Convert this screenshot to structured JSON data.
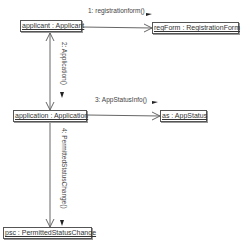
{
  "diagram": {
    "type": "uml-collaboration",
    "objects": [
      {
        "id": "applicant",
        "label": "applicant : Applicant"
      },
      {
        "id": "regForm",
        "label": "regForm : RegistrationForm"
      },
      {
        "id": "application",
        "label": "application : Application"
      },
      {
        "id": "as",
        "label": "as : AppStatus"
      },
      {
        "id": "psc",
        "label": "psc : PermittedStatusChange"
      }
    ],
    "messages": [
      {
        "seq": "1",
        "label": "1: registrationform()",
        "from": "applicant",
        "to": "regForm",
        "arrow": "→"
      },
      {
        "seq": "2",
        "label": "2: Application()",
        "from": "applicant",
        "to": "application",
        "arrow": "→"
      },
      {
        "seq": "3",
        "label": "3: AppStatusInfo()",
        "from": "application",
        "to": "as",
        "arrow": "→"
      },
      {
        "seq": "4",
        "label": "4: PermittedStatusChange()",
        "from": "application",
        "to": "psc",
        "arrow": "→"
      }
    ],
    "colors": {
      "line": "#555555",
      "text": "#333333",
      "background": "#ffffff"
    }
  }
}
